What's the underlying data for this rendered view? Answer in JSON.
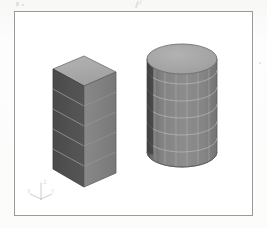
{
  "figure": {
    "kind": "cad-viewport-screenshot",
    "background_color": "#ffffff",
    "page_color": "#fbfbfa",
    "border_color": "#9a9a9a"
  },
  "viewport": {
    "name": "3d-model-viewport",
    "projection": "isometric"
  },
  "axis_triad": {
    "name": "axis-triad",
    "x_label": "X",
    "y_label": "Y",
    "z_label": "Z",
    "color": "#9aa0a6"
  },
  "models": [
    {
      "id": "box",
      "label": "Rectangular Prism",
      "shape": "box",
      "mesh": "structured-quad",
      "mesh_rows": 5,
      "mesh_columns": 1,
      "faces": {
        "top_color": "#a9a9a9",
        "left_color": "#4f4f4f",
        "right_color": "#818181"
      },
      "edge_color": "#5a5a5a",
      "mesh_line_color": "#c8c8c8"
    },
    {
      "id": "cylinder",
      "label": "Cylinder",
      "shape": "cylinder",
      "mesh": "structured-quad",
      "mesh_rows": 6,
      "mesh_columns": 12,
      "faces": {
        "top_color": "#a6a6a6",
        "body_color": "#838383",
        "shadow_color": "#3d3d3d"
      },
      "edge_color": "#5a5a5a",
      "mesh_line_color": "#c9c9c9"
    }
  ],
  "scan_marks": [
    {
      "name": "scan-speckle-1",
      "x": 16,
      "y": 2,
      "w": 3,
      "h": 4
    },
    {
      "name": "scan-speckle-2",
      "x": 22,
      "y": 4,
      "w": 2,
      "h": 2
    },
    {
      "name": "scan-speckle-3",
      "x": 136,
      "y": 1,
      "w": 2,
      "h": 7
    },
    {
      "name": "scan-speckle-4",
      "x": 139,
      "y": 0,
      "w": 1,
      "h": 5
    },
    {
      "name": "scan-speckle-5",
      "x": 259,
      "y": 62,
      "w": 2,
      "h": 2
    }
  ]
}
